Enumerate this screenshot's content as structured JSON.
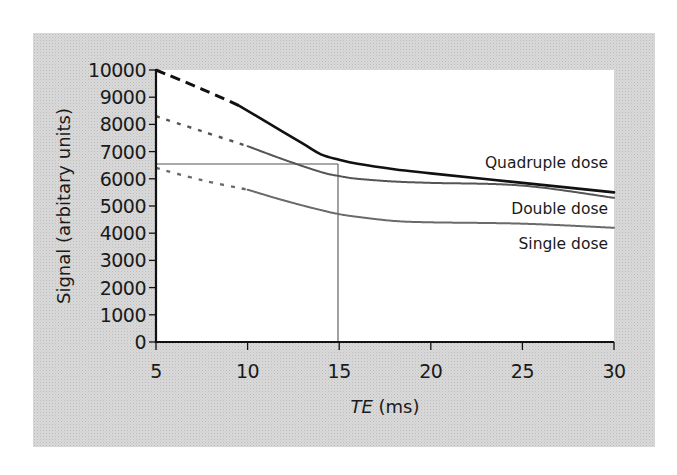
{
  "chart_data": {
    "type": "line",
    "title": "",
    "xlabel_italic": "TE",
    "xlabel_unit": "(ms)",
    "xlabel": "TE (ms)",
    "ylabel": "Signal (arbitary units)",
    "xlim": [
      5,
      30
    ],
    "ylim": [
      0,
      10000
    ],
    "x_ticks": [
      5,
      10,
      15,
      20,
      25,
      30
    ],
    "y_ticks": [
      0,
      1000,
      2000,
      3000,
      4000,
      5000,
      6000,
      7000,
      8000,
      9000,
      10000
    ],
    "grid": false,
    "legend_position": "inline-right",
    "series": [
      {
        "name": "Quadruple dose",
        "style": "solid-black",
        "dashed_until_x": 9.5,
        "x": [
          5,
          7.5,
          9.5,
          11,
          13,
          14,
          15,
          16,
          18,
          20,
          25,
          30
        ],
        "values": [
          10000,
          9300,
          8700,
          8100,
          7300,
          6900,
          6700,
          6550,
          6350,
          6200,
          5850,
          5500
        ]
      },
      {
        "name": "Double dose",
        "style": "dotted-gray",
        "dashed_until_x": 10.5,
        "x": [
          5,
          7.5,
          10,
          12,
          14,
          15,
          16,
          18,
          20,
          25,
          30
        ],
        "values": [
          8300,
          7750,
          7200,
          6700,
          6250,
          6100,
          6000,
          5900,
          5850,
          5750,
          5300
        ]
      },
      {
        "name": "Single dose",
        "style": "dotted-gray",
        "dashed_until_x": 10.5,
        "x": [
          5,
          7.5,
          10,
          12,
          14,
          15,
          16,
          18,
          20,
          25,
          30
        ],
        "values": [
          6400,
          5950,
          5600,
          5200,
          4850,
          4700,
          4600,
          4450,
          4400,
          4350,
          4200
        ]
      }
    ],
    "annotations": [
      {
        "type": "reference-box",
        "x_from": 5,
        "x_to": 15,
        "y_from": 0,
        "y_to": 6550,
        "description": "Thin reference lines at TE = 15 ms and Signal ≈ 6550"
      }
    ]
  },
  "labels": {
    "y_ticks": [
      "0",
      "1000",
      "2000",
      "3000",
      "4000",
      "5000",
      "6000",
      "7000",
      "8000",
      "9000",
      "10000"
    ],
    "x_ticks": [
      "5",
      "10",
      "15",
      "20",
      "25",
      "30"
    ],
    "series": [
      "Quadruple dose",
      "Double dose",
      "Single dose"
    ],
    "ylabel": "Signal (arbitary units)",
    "xlabel_italic": "TE",
    "xlabel_unit": " (ms)"
  },
  "colors": {
    "frame_bg": "#d9d9d9",
    "plot_bg": "#ffffff",
    "axis": "#111111",
    "quadruple": "#111111",
    "double": "#555555",
    "single": "#6a6a6a",
    "reference": "#555555"
  }
}
